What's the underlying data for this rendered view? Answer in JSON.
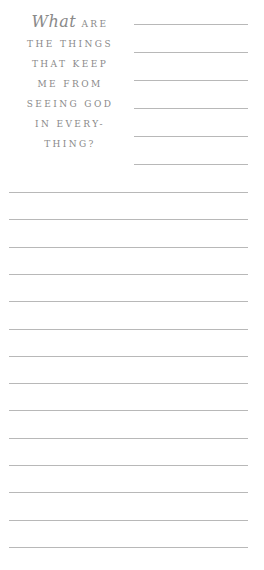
{
  "prompt": {
    "script_word": "What",
    "lines": [
      "ARE",
      "THE THINGS",
      "THAT KEEP",
      "ME FROM",
      "SEEING GOD",
      "IN EVERY-",
      "THING?"
    ]
  },
  "ruled_lines": {
    "short_count": 6,
    "full_count": 15,
    "color": "#b8b8b8"
  }
}
